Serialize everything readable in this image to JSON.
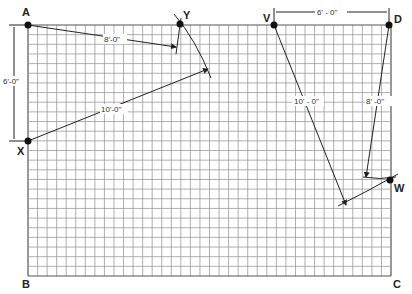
{
  "diagram": {
    "grid": {
      "left": 28,
      "top": 25,
      "right": 391,
      "bottom": 276,
      "cols": 38,
      "rows": 26,
      "line_color": "#9a9a9a",
      "border_color": "#555555"
    },
    "points": {
      "A": {
        "label": "A",
        "x": 28,
        "y": 25
      },
      "X": {
        "label": "X",
        "x": 28,
        "y": 141
      },
      "Y": {
        "label": "Y",
        "x": 180,
        "y": 24
      },
      "V": {
        "label": "V",
        "x": 274,
        "y": 25
      },
      "D": {
        "label": "D",
        "x": 389,
        "y": 25
      },
      "W": {
        "label": "W",
        "x": 390,
        "y": 180
      }
    },
    "corners": {
      "B": "B",
      "C": "C"
    },
    "dimensions": {
      "AX": "6'-0\"",
      "AY": "8'-0\"",
      "XY": "10'-0\"",
      "VD": "6' - 0''",
      "VW": "10' - 0''",
      "DW": "8' -0''"
    }
  }
}
